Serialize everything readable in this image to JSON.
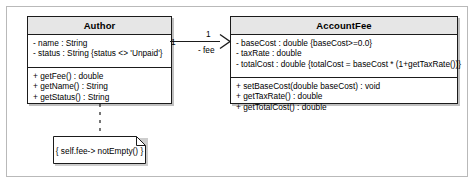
{
  "diagram": {
    "type": "uml-class-diagram",
    "colors": {
      "header_fill": "#e6e6e6",
      "box_fill": "#ffffff",
      "stroke": "#1b1b1b",
      "frame": "#b9b9b9",
      "shadow": "rgba(90,90,90,0.38)"
    },
    "classes": [
      {
        "name": "Author",
        "attributes": [
          "- name : String",
          "- status : String {status <> 'Unpaid'}"
        ],
        "operations": [
          "+ getFee() : double",
          "+ getName() : String",
          "+ getStatus() : String"
        ]
      },
      {
        "name": "AccountFee",
        "attributes": [
          "- baseCost : double {baseCost>=0.0}",
          "- taxRate : double",
          "- totalCost : double {totalCost = baseCost * (1+getTaxRate())}"
        ],
        "operations": [
          "+ setBaseCost(double baseCost) : void",
          "+ getTaxRate() : double",
          "+ getTotalCost() : double"
        ]
      }
    ],
    "association": {
      "source_multiplicity": "1",
      "target_multiplicity": "1",
      "target_role": "- fee",
      "arrow": "open-navigable-arrowhead",
      "direction": "Author-to-AccountFee"
    },
    "note": {
      "text": "{ self.fee-> notEmpty() }",
      "anchor": "Author",
      "connector": "dashed"
    }
  }
}
